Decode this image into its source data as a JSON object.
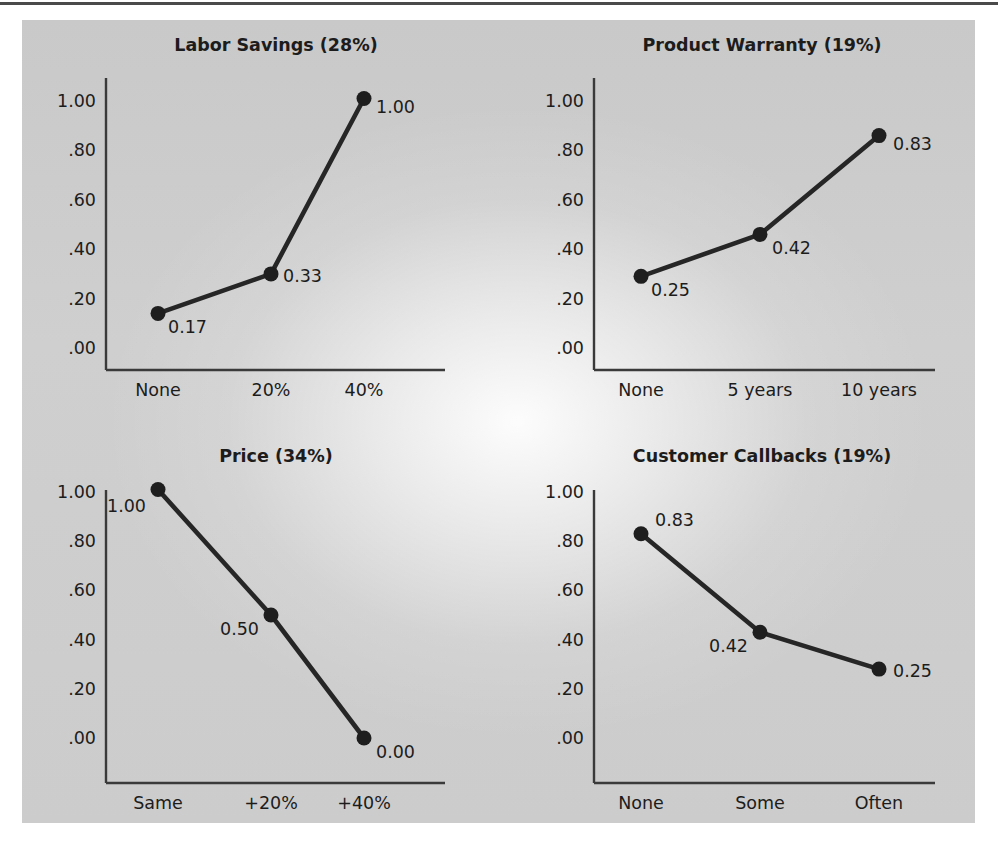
{
  "figure": {
    "background_color": "#cccccc",
    "page_color": "#ffffff",
    "rule_color": "#4a4a4a",
    "line_color": "#262626",
    "axis_color": "#3a3a3a",
    "text_color": "#1c1c1c"
  },
  "chart_data": [
    {
      "type": "line",
      "title": "Labor Savings (28%)",
      "xlabel": "",
      "ylabel": "",
      "categories": [
        "None",
        "20%",
        "40%"
      ],
      "values": [
        0.17,
        0.33,
        1.0
      ],
      "plotted": [
        0.14,
        0.3,
        1.01
      ],
      "point_labels": [
        "0.17",
        "0.33",
        "1.00"
      ],
      "label_anchor": [
        "start",
        "start",
        "start"
      ],
      "label_dx": [
        10,
        12,
        12
      ],
      "label_dy": [
        20,
        8,
        14
      ],
      "ylim": [
        0.0,
        1.0
      ],
      "yticks": [
        1.0,
        0.8,
        0.6,
        0.4,
        0.2,
        0.0
      ],
      "ytick_labels": [
        "1.00",
        ".80",
        ".60",
        ".40",
        ".20",
        ".00"
      ],
      "grid": false,
      "legend": "none"
    },
    {
      "type": "line",
      "title": "Product Warranty (19%)",
      "xlabel": "",
      "ylabel": "",
      "categories": [
        "None",
        "5 years",
        "10 years"
      ],
      "values": [
        0.25,
        0.42,
        0.83
      ],
      "plotted": [
        0.29,
        0.46,
        0.86
      ],
      "point_labels": [
        "0.25",
        "0.42",
        "0.83"
      ],
      "label_anchor": [
        "start",
        "start",
        "start"
      ],
      "label_dx": [
        10,
        12,
        14
      ],
      "label_dy": [
        20,
        20,
        14
      ],
      "ylim": [
        0.0,
        1.0
      ],
      "yticks": [
        1.0,
        0.8,
        0.6,
        0.4,
        0.2,
        0.0
      ],
      "ytick_labels": [
        "1.00",
        ".80",
        ".60",
        ".40",
        ".20",
        ".00"
      ],
      "grid": false,
      "legend": "none"
    },
    {
      "type": "line",
      "title": "Price (34%)",
      "xlabel": "",
      "ylabel": "",
      "categories": [
        "Same",
        "+20%",
        "+40%"
      ],
      "values": [
        1.0,
        0.5,
        0.0
      ],
      "plotted": [
        1.01,
        0.5,
        0.0
      ],
      "point_labels": [
        "1.00",
        "0.50",
        "0.00"
      ],
      "label_anchor": [
        "end",
        "end",
        "start"
      ],
      "label_dx": [
        -12,
        -12,
        12
      ],
      "label_dy": [
        22,
        20,
        20
      ],
      "ylim": [
        0.0,
        1.0
      ],
      "yticks": [
        1.0,
        0.8,
        0.6,
        0.4,
        0.2,
        0.0
      ],
      "ytick_labels": [
        "1.00",
        ".80",
        ".60",
        ".40",
        ".20",
        ".00"
      ],
      "grid": false,
      "legend": "none"
    },
    {
      "type": "line",
      "title": "Customer Callbacks (19%)",
      "xlabel": "",
      "ylabel": "",
      "categories": [
        "None",
        "Some",
        "Often"
      ],
      "values": [
        0.83,
        0.42,
        0.25
      ],
      "plotted": [
        0.83,
        0.43,
        0.28
      ],
      "point_labels": [
        "0.83",
        "0.42",
        "0.25"
      ],
      "label_anchor": [
        "start",
        "end",
        "start"
      ],
      "label_dx": [
        14,
        -12,
        14
      ],
      "label_dy": [
        -8,
        20,
        8
      ],
      "ylim": [
        0.0,
        1.0
      ],
      "yticks": [
        1.0,
        0.8,
        0.6,
        0.4,
        0.2,
        0.0
      ],
      "ytick_labels": [
        "1.00",
        ".80",
        ".60",
        ".40",
        ".20",
        ".00"
      ],
      "grid": false,
      "legend": "none"
    }
  ],
  "layout": {
    "panels": [
      {
        "title_x": 276,
        "title_y": 51,
        "x0": 106,
        "y_top": 78,
        "y_base": 370,
        "x_axis_end": 445,
        "y_1_00": 101,
        "y_0_00": 348,
        "cat_x": [
          158,
          271,
          364
        ]
      },
      {
        "title_x": 762,
        "title_y": 51,
        "x0": 594,
        "y_top": 78,
        "y_base": 370,
        "x_axis_end": 935,
        "y_1_00": 101,
        "y_0_00": 348,
        "cat_x": [
          641,
          760,
          879
        ]
      },
      {
        "title_x": 276,
        "title_y": 462,
        "x0": 106,
        "y_top": 490,
        "y_base": 783,
        "x_axis_end": 445,
        "y_1_00": 492,
        "y_0_00": 738,
        "cat_x": [
          158,
          271,
          364
        ]
      },
      {
        "title_x": 762,
        "title_y": 462,
        "x0": 594,
        "y_top": 490,
        "y_base": 783,
        "x_axis_end": 935,
        "y_1_00": 492,
        "y_0_00": 738,
        "cat_x": [
          641,
          760,
          879
        ]
      }
    ],
    "ytick_label_offset": -10,
    "xtick_label_offset": 26,
    "dot_radius": 7.5
  }
}
